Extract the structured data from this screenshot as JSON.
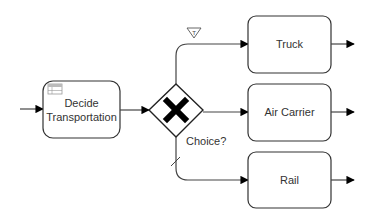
{
  "diagram": {
    "type": "BPMN process",
    "start_task": {
      "label_line1": "Decide",
      "label_line2": "Transportation",
      "marker": "business-rule-table-icon"
    },
    "gateway": {
      "kind": "exclusive",
      "marker": "x-icon",
      "label": "Choice?"
    },
    "branches": [
      {
        "target": "Truck",
        "marker": "conditional-flow-T-triangle"
      },
      {
        "target": "Air Carrier",
        "marker": ""
      },
      {
        "target": "Rail",
        "marker": "default-flow-slash"
      }
    ],
    "tasks": {
      "truck": "Truck",
      "air": "Air Carrier",
      "rail": "Rail"
    },
    "conditional_marker_text": "T",
    "colors": {
      "stroke": "#333333",
      "fill": "#ffffff",
      "marker": "#000000"
    }
  }
}
